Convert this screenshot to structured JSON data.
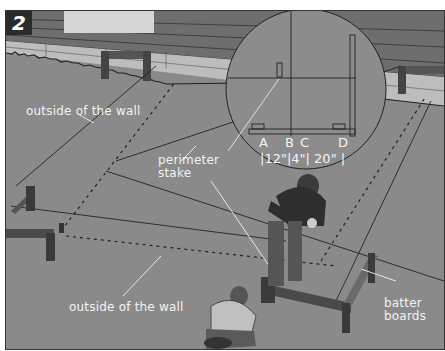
{
  "figure": {
    "step_number": "2",
    "colors": {
      "ground": "#8a8a8a",
      "siding": "#6e6e6e",
      "foundation": "#bdbdbd",
      "label_text": "#f2f2f2",
      "line": "#222222"
    }
  },
  "labels": {
    "outside_wall_top": "outside of the wall",
    "outside_wall_bottom": "outside of the wall",
    "perimeter_stake_line1": "perimeter",
    "perimeter_stake_line2": "stake",
    "batter_boards_line1": "batter",
    "batter_boards_line2": "boards"
  },
  "inset": {
    "points": [
      "A",
      "B",
      "C",
      "D"
    ],
    "measurements": [
      "12\"",
      "4\"",
      "20\""
    ]
  }
}
